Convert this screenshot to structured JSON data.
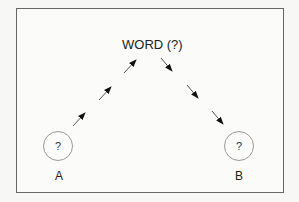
{
  "diagram": {
    "top_node": {
      "label": "WORD (?)"
    },
    "left_node": {
      "symbol": "?",
      "label": "A"
    },
    "right_node": {
      "symbol": "?",
      "label": "B"
    },
    "edges": [
      {
        "from": "A",
        "to": "WORD (?)",
        "style": "dashed-arrows",
        "direction": "up"
      },
      {
        "from": "WORD (?)",
        "to": "B",
        "style": "dashed-arrows",
        "direction": "down"
      }
    ]
  }
}
